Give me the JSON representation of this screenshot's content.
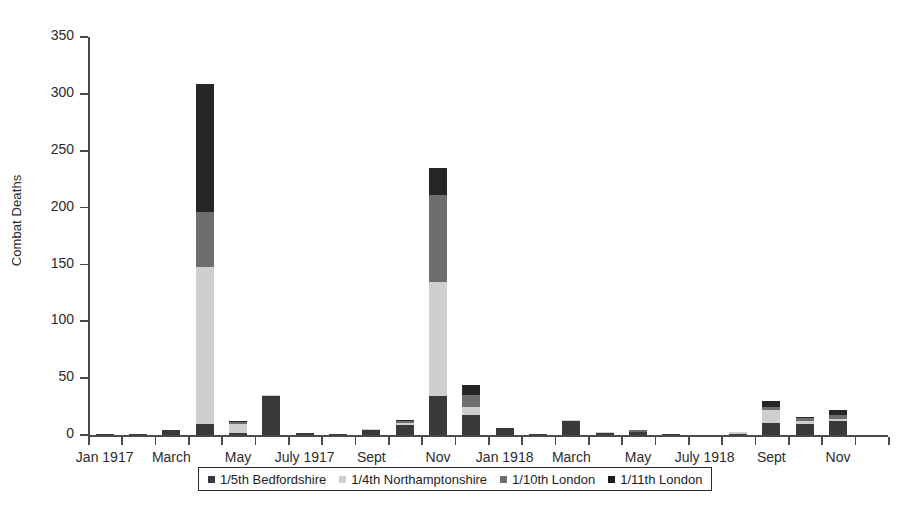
{
  "chart_data": {
    "type": "bar",
    "subtype": "stacked",
    "title": "",
    "xlabel": "",
    "ylabel": "Combat Deaths",
    "ylim": [
      0,
      350
    ],
    "yticks": [
      0,
      50,
      100,
      150,
      200,
      250,
      300,
      350
    ],
    "grid": false,
    "legend_position": "bottom",
    "categories": [
      "Jan 1917",
      "Feb 1917",
      "March 1917",
      "April 1917",
      "May 1917",
      "June 1917",
      "July 1917",
      "Aug 1917",
      "Sept 1917",
      "Oct 1917",
      "Nov 1917",
      "Dec 1917",
      "Jan 1918",
      "Feb 1918",
      "March 1918",
      "April 1918",
      "May 1918",
      "June 1918",
      "July 1918",
      "Aug 1918",
      "Sept 1918",
      "Oct 1918",
      "Nov 1918",
      "Dec 1918"
    ],
    "tick_labels": [
      "Jan 1917",
      "",
      "March",
      "",
      "May",
      "",
      "July 1917",
      "",
      "Sept",
      "",
      "Nov",
      "",
      "Jan 1918",
      "",
      "March",
      "",
      "May",
      "",
      "July 1918",
      "",
      "Sept",
      "",
      "Nov",
      ""
    ],
    "series": [
      {
        "name": "1/5th Bedfordshire",
        "color": "#3a3a3a",
        "values": [
          1,
          1,
          4,
          10,
          2,
          34,
          2,
          1,
          4,
          9,
          34,
          18,
          6,
          1,
          12,
          2,
          3,
          1,
          0,
          1,
          11,
          10,
          12,
          0
        ]
      },
      {
        "name": "1/4th Northamptonshire",
        "color": "#cfcfcf",
        "values": [
          0,
          0,
          0,
          138,
          8,
          1,
          0,
          0,
          1,
          2,
          101,
          7,
          0,
          0,
          1,
          1,
          0,
          0,
          0,
          2,
          11,
          2,
          2,
          0
        ]
      },
      {
        "name": "1/10th London",
        "color": "#6e6e6e",
        "values": [
          0,
          0,
          0,
          48,
          1,
          0,
          0,
          0,
          0,
          1,
          76,
          10,
          0,
          0,
          0,
          0,
          1,
          0,
          0,
          0,
          3,
          3,
          4,
          0
        ]
      },
      {
        "name": "1/11th London",
        "color": "#262626",
        "values": [
          0,
          0,
          0,
          113,
          1,
          0,
          0,
          0,
          0,
          1,
          24,
          9,
          0,
          0,
          0,
          0,
          0,
          0,
          0,
          0,
          5,
          1,
          4,
          0
        ]
      }
    ],
    "totals": [
      1,
      1,
      4,
      309,
      12,
      35,
      2,
      1,
      5,
      13,
      235,
      44,
      6,
      1,
      13,
      3,
      4,
      1,
      0,
      3,
      30,
      16,
      22,
      0
    ]
  }
}
